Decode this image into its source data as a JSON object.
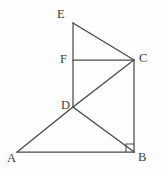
{
  "figure": {
    "type": "geometry-diagram",
    "background_color": "#fefefe",
    "line_color": "#4a4a4a",
    "label_color": "#3d3d3d",
    "width": 161,
    "height": 171,
    "vertices": {
      "A": {
        "label": "A",
        "x": 17,
        "y": 152
      },
      "B": {
        "label": "B",
        "x": 134,
        "y": 152
      },
      "C": {
        "label": "C",
        "x": 134,
        "y": 60
      },
      "D": {
        "label": "D",
        "x": 73,
        "y": 107
      },
      "E": {
        "label": "E",
        "x": 73,
        "y": 23
      },
      "F": {
        "label": "F",
        "x": 73,
        "y": 60
      }
    },
    "segments": [
      {
        "name": "segment-EC",
        "from": "E",
        "to": "C"
      },
      {
        "name": "segment-ED",
        "from": "E",
        "to": "D"
      },
      {
        "name": "segment-FC",
        "from": "F",
        "to": "C"
      },
      {
        "name": "segment-DC",
        "from": "D",
        "to": "C"
      },
      {
        "name": "segment-DA",
        "from": "D",
        "to": "A"
      },
      {
        "name": "segment-DB",
        "from": "D",
        "to": "B"
      },
      {
        "name": "segment-AB",
        "from": "A",
        "to": "B"
      },
      {
        "name": "segment-CB",
        "from": "C",
        "to": "B"
      }
    ],
    "right_angles": [
      {
        "name": "right-angle-at-B",
        "at": "B",
        "size": 8
      }
    ]
  }
}
